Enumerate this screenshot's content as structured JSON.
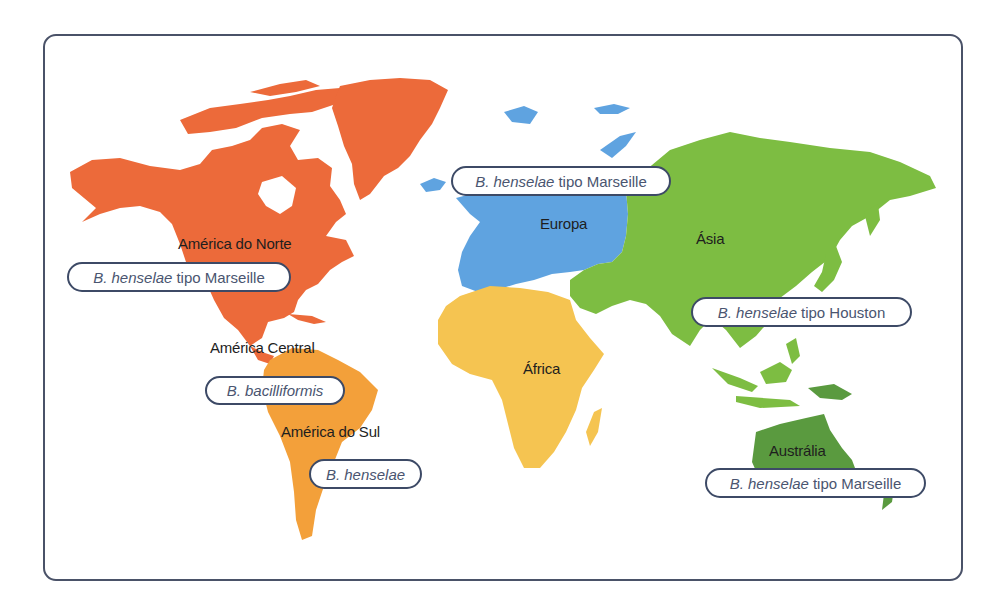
{
  "figure": {
    "type": "world-map",
    "colors": {
      "north_america": "#ec6a3a",
      "south_america": "#f3a03a",
      "europe": "#5fa3e0",
      "africa": "#f5c451",
      "asia": "#7dbd42",
      "australia": "#5a9a3f",
      "frame_border": "#4a5268",
      "pill_border": "#3d4a66",
      "pill_text": "#4a5570",
      "label_text": "#1e1e1e"
    }
  },
  "regions": [
    {
      "id": "north_america",
      "label": "América do Norte"
    },
    {
      "id": "central_america",
      "label": "América Central"
    },
    {
      "id": "south_america",
      "label": "América do Sul"
    },
    {
      "id": "europe",
      "label": "Europa"
    },
    {
      "id": "africa",
      "label": "África"
    },
    {
      "id": "asia",
      "label": "Ásia"
    },
    {
      "id": "australia",
      "label": "Austrália"
    }
  ],
  "annotations": [
    {
      "region": "north_america",
      "species": "B. henselae",
      "suffix": "tipo Marseille"
    },
    {
      "region": "central_america",
      "species": "B. bacilliformis",
      "suffix": ""
    },
    {
      "region": "south_america",
      "species": "B. henselae",
      "suffix": ""
    },
    {
      "region": "europe",
      "species": "B. henselae",
      "suffix": "tipo Marseille"
    },
    {
      "region": "asia",
      "species": "B. henselae",
      "suffix": "tipo Houston"
    },
    {
      "region": "australia",
      "species": "B. henselae",
      "suffix": "tipo Marseille"
    }
  ]
}
